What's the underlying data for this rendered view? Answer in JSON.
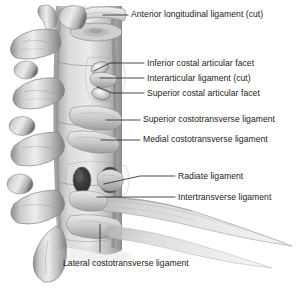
{
  "figure": {
    "style": "grayscale anatomical airbrush illustration",
    "width": 306,
    "height": 288,
    "background_color": "#ffffff",
    "text_color": "#1b1b1b",
    "leader_color": "#2b2b2b"
  },
  "labels": [
    {
      "id": "anterior-longitudinal-ligament-cut",
      "text": "Anterior longitudinal ligament (cut)",
      "text_x": 131,
      "text_y": 9,
      "leader": [
        [
          103,
          15
        ],
        [
          128,
          15
        ]
      ]
    },
    {
      "id": "inferior-costal-articular-facet",
      "text": "Inferior costal articular facet",
      "text_x": 147,
      "text_y": 58,
      "leader": [
        [
          94,
          71
        ],
        [
          110,
          63
        ],
        [
          144,
          63
        ]
      ]
    },
    {
      "id": "interarticular-ligament-cut",
      "text": "Interarticular ligament (cut)",
      "text_x": 147,
      "text_y": 73,
      "leader": [
        [
          100,
          78
        ],
        [
          144,
          78
        ]
      ]
    },
    {
      "id": "superior-costal-articular-facet",
      "text": "Superior costal articular facet",
      "text_x": 147,
      "text_y": 88,
      "leader": [
        [
          97,
          87
        ],
        [
          112,
          93
        ],
        [
          144,
          93
        ]
      ]
    },
    {
      "id": "superior-costotransverse-ligament",
      "text": "Superior costotransverse ligament",
      "text_x": 143,
      "text_y": 114,
      "leader": [
        [
          106,
          120
        ],
        [
          140,
          120
        ]
      ]
    },
    {
      "id": "medial-costotransverse-ligament",
      "text": "Medial costotransverse ligament",
      "text_x": 143,
      "text_y": 134,
      "leader": [
        [
          101,
          140
        ],
        [
          140,
          140
        ]
      ]
    },
    {
      "id": "radiate-ligament",
      "text": "Radiate ligament",
      "text_x": 178,
      "text_y": 171,
      "leader": [
        [
          104,
          184
        ],
        [
          140,
          176
        ],
        [
          175,
          176
        ]
      ]
    },
    {
      "id": "intertransverse-ligament",
      "text": "Intertransverse ligament",
      "text_x": 178,
      "text_y": 192,
      "leader": [
        [
          97,
          197
        ],
        [
          175,
          197
        ]
      ]
    },
    {
      "id": "lateral-costotransverse-ligament",
      "text": "Lateral costotransverse ligament",
      "text_x": 63,
      "text_y": 258,
      "leader": [
        [
          100,
          224
        ],
        [
          100,
          252
        ]
      ]
    }
  ]
}
